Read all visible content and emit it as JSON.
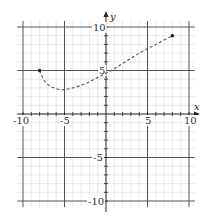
{
  "chart_data": {
    "type": "line",
    "title": "",
    "xlabel": "x",
    "ylabel": "y",
    "xlim": [
      -10,
      10
    ],
    "ylim": [
      -10,
      10
    ],
    "grid": true,
    "minor_grid_step": 1,
    "major_grid_step": 5,
    "x_ticks": [
      -10,
      -5,
      5,
      10
    ],
    "y_ticks": [
      10,
      5,
      -5,
      -10
    ],
    "x_tick_labels": [
      "-10",
      "-5",
      "5",
      "10"
    ],
    "y_tick_labels": [
      "10",
      "5",
      "-5",
      "-10"
    ],
    "series": [
      {
        "name": "curve",
        "style": "dashed",
        "color": "#555555",
        "endpoints_marked": true,
        "x": [
          -8,
          -7.5,
          -7,
          -6.5,
          -6,
          -5.5,
          -5,
          -4,
          -3,
          -2,
          -1,
          0,
          1,
          2,
          3,
          4,
          5,
          6,
          7,
          8
        ],
        "y": [
          5,
          3.9,
          3.4,
          3.1,
          2.9,
          2.8,
          2.8,
          3.0,
          3.3,
          3.7,
          4.2,
          4.7,
          5.2,
          5.8,
          6.4,
          7.0,
          7.5,
          8.0,
          8.5,
          9.0
        ]
      }
    ],
    "legend": null
  },
  "colors": {
    "minor_grid": "#dcdcdc",
    "major_grid": "#555555",
    "axis": "#222222",
    "curve": "#555555"
  }
}
